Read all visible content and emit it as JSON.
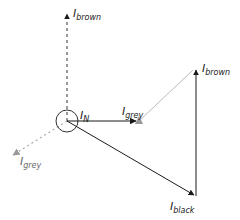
{
  "diagram": {
    "type": "phasor-diagram",
    "neutral": {
      "label": "I",
      "sub": "N",
      "center": [
        67,
        121
      ],
      "radius": 11
    },
    "colors": {
      "black": "#1a1a1a",
      "grey": "#999999",
      "dashed_black": "#333333"
    },
    "vectors": [
      {
        "id": "brown-dashed",
        "from": [
          67,
          121
        ],
        "to": [
          67,
          12
        ],
        "style": "dashed",
        "color": "#333333",
        "label": "I",
        "sub": "brown",
        "label_pos": [
          73,
          8
        ]
      },
      {
        "id": "grey-dashed",
        "from": [
          67,
          121
        ],
        "to": [
          12,
          156
        ],
        "style": "dotted",
        "color": "#aaaaaa",
        "label": "I",
        "sub": "grey",
        "label_pos": [
          20,
          157
        ]
      },
      {
        "id": "grey-solid",
        "from": [
          67,
          121
        ],
        "to": [
          139,
          121
        ],
        "style": "solid",
        "color": "#1a1a1a",
        "label": "I",
        "sub": "grey",
        "label_pos": [
          123,
          106
        ]
      },
      {
        "id": "black-solid",
        "from": [
          67,
          121
        ],
        "to": [
          196,
          196
        ],
        "style": "solid",
        "color": "#1a1a1a",
        "label": "I",
        "sub": "black",
        "label_pos": [
          170,
          201
        ]
      },
      {
        "id": "brown-solid",
        "from": [
          196,
          196
        ],
        "to": [
          196,
          68
        ],
        "style": "solid",
        "color": "#1a1a1a",
        "label": "I",
        "sub": "brown",
        "label_pos": [
          202,
          63
        ]
      },
      {
        "id": "grey-light",
        "from": [
          139,
          121
        ],
        "to": [
          196,
          68
        ],
        "style": "solid",
        "color": "#bbbbbb",
        "label": "",
        "sub": ""
      }
    ]
  },
  "labels": {
    "in": {
      "main": "I",
      "sub": "N"
    },
    "brown_top": {
      "main": "I",
      "sub": "brown"
    },
    "grey_bottom_left": {
      "main": "I",
      "sub": "grey"
    },
    "grey_mid": {
      "main": "I",
      "sub": "grey"
    },
    "brown_right": {
      "main": "I",
      "sub": "brown"
    },
    "black_bottom": {
      "main": "I",
      "sub": "black"
    }
  }
}
